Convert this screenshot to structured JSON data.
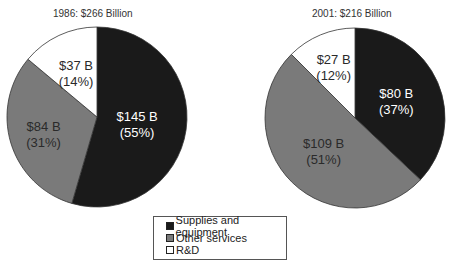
{
  "chart_data": [
    {
      "type": "pie",
      "title": "1986: $266 Billion",
      "total": 266,
      "unit": "Billion USD",
      "categories": [
        "Supplies and equipment",
        "Other services",
        "R&D"
      ],
      "values": [
        145,
        84,
        37
      ],
      "percentages": [
        55,
        31,
        14
      ],
      "labels": [
        {
          "value": "$145 B",
          "pct": "(55%)"
        },
        {
          "value": "$84 B",
          "pct": "(31%)"
        },
        {
          "value": "$37 B",
          "pct": "(14%)"
        }
      ]
    },
    {
      "type": "pie",
      "title": "2001: $216 Billion",
      "total": 216,
      "unit": "Billion USD",
      "categories": [
        "Supplies and equipment",
        "Other services",
        "R&D"
      ],
      "values": [
        80,
        109,
        27
      ],
      "percentages": [
        37,
        51,
        12
      ],
      "labels": [
        {
          "value": "$80 B",
          "pct": "(37%)"
        },
        {
          "value": "$109 B",
          "pct": "(51%)"
        },
        {
          "value": "$27 B",
          "pct": "(12%)"
        }
      ]
    }
  ],
  "legend": {
    "items": [
      {
        "label": "Supplies and equipment",
        "color": "#1a1a1a"
      },
      {
        "label": "Other services",
        "color": "#7a7a7a"
      },
      {
        "label": "R&D",
        "color": "#ffffff"
      }
    ],
    "position": "bottom-center"
  }
}
